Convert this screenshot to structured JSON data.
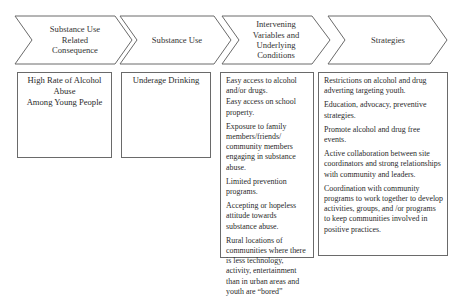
{
  "diagram": {
    "stages": [
      {
        "label": "Substance Use Related Consequence",
        "lines": [
          "Substance Use",
          "Related",
          "Consequence"
        ]
      },
      {
        "label": "Substance Use",
        "lines": [
          "Substance Use"
        ]
      },
      {
        "label": "Intervening Variables and Underlying Conditions",
        "lines": [
          "Intervening",
          "Variables and",
          "Underlying",
          "Conditions"
        ]
      },
      {
        "label": "Strategies",
        "lines": [
          "Strategies"
        ]
      }
    ],
    "boxes": [
      {
        "lines": [
          "High Rate of Alcohol Abuse",
          "Among Young People"
        ]
      },
      {
        "lines": [
          "Underage Drinking"
        ]
      },
      {
        "items": [
          "Easy access to alcohol and/or drugs.",
          "Easy access on school property.",
          "Exposure to family members/friends/ community members engaging in substance abuse.",
          "Limited prevention programs.",
          "Accepting or hopeless attitude towards substance abuse.",
          "Rural locations of communities where there is less technology, activity, entertainment than in urban areas and youth are “bored”"
        ]
      },
      {
        "items": [
          "Restrictions on alcohol and drug adverting targeting youth.",
          "Education, advocacy, preventive strategies.",
          "Promote alcohol and drug free events.",
          "Active collaboration between site coordinators and strong relationships with community and leaders.",
          "Coordination with community programs to work together to develop activities, groups, and /or programs to keep communities involved in positive practices."
        ]
      }
    ],
    "colors": {
      "stroke": "#6a6a6a",
      "text": "#333333",
      "background": "#ffffff"
    }
  }
}
